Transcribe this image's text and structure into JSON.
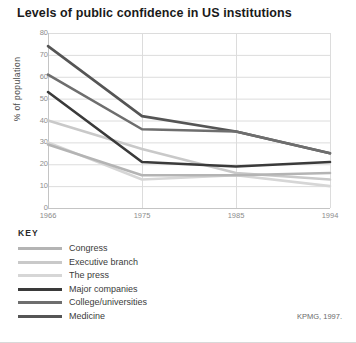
{
  "title": "Levels of public confidence in US institutions",
  "source": "KPMG, 1997.",
  "key": {
    "heading": "KEY"
  },
  "axis": {
    "ylabel": "% of population",
    "yticks": [
      "80",
      "70",
      "60",
      "50",
      "40",
      "30",
      "20",
      "10",
      "0"
    ],
    "xticks": [
      "1966",
      "1975",
      "1985",
      "1994"
    ]
  },
  "chart_data": {
    "type": "line",
    "title": "Levels of public confidence in US institutions",
    "xlabel": "",
    "ylabel": "% of population",
    "categories": [
      "1966",
      "1975",
      "1985",
      "1994"
    ],
    "x": [
      1966,
      1975,
      1985,
      1994
    ],
    "ylim": [
      0,
      80
    ],
    "ytick_step": 10,
    "grid": true,
    "legend_position": "below-plot",
    "series": [
      {
        "name": "Congress",
        "color": "#b4b4b4",
        "values": [
          29,
          15,
          15,
          16
        ]
      },
      {
        "name": "Executive branch",
        "color": "#c9c9c9",
        "values": [
          40,
          27,
          16,
          13
        ]
      },
      {
        "name": "The press",
        "color": "#d6d6d6",
        "values": [
          30,
          13,
          15,
          10
        ]
      },
      {
        "name": "Major companies",
        "color": "#3a3a3a",
        "values": [
          53,
          21,
          19,
          21
        ]
      },
      {
        "name": "College/universities",
        "color": "#6e6e6e",
        "values": [
          61,
          36,
          35,
          25
        ]
      },
      {
        "name": "Medicine",
        "color": "#555555",
        "values": [
          74,
          42,
          35,
          25
        ]
      }
    ]
  },
  "colors": {
    "grid": "#dcdcdc",
    "axis_text": "#8c8c8c",
    "title_text": "#1a1a1a",
    "background": "#ffffff"
  }
}
